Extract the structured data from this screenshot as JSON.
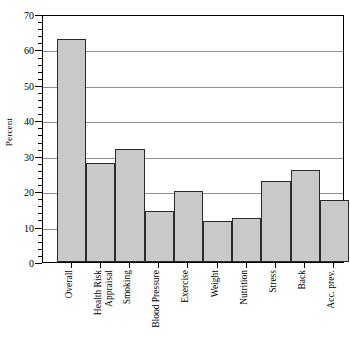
{
  "chart_data": {
    "type": "bar",
    "title": "",
    "xlabel": "",
    "ylabel": "Percent",
    "categories": [
      "Overall",
      "Health Risk\nAppraisal",
      "Smoking",
      "Blood Pressure",
      "Exercise",
      "Weight",
      "Nutrition",
      "Stress",
      "Back",
      "Acc. prev."
    ],
    "values": [
      63,
      28,
      32,
      14.5,
      20,
      11.5,
      12.5,
      23,
      26,
      17.5
    ],
    "ylim": [
      0,
      70
    ],
    "ytick_labels": [
      "0",
      "10",
      "20",
      "30",
      "40",
      "50",
      "60",
      "70"
    ],
    "ytick_values": [
      0,
      10,
      20,
      30,
      40,
      50,
      60,
      70
    ],
    "ytick_minor_step": 2,
    "grid": "horizontal",
    "legend": "none",
    "bar_fill_color": "#c9c9c9",
    "bar_edge_color": "#2b2b2b",
    "gridline_color": "#8f8f8f",
    "axis_color": "#000000"
  }
}
